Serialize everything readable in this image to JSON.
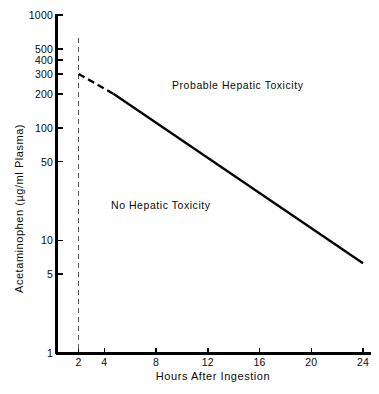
{
  "chart_data": {
    "type": "line",
    "title": "",
    "xlabel": "Hours After Ingestion",
    "ylabel": "Acetaminophen (µg/ml Plasma)",
    "xscale": "linear",
    "yscale": "log",
    "xlim": [
      0.7,
      25.2
    ],
    "ylim": [
      1,
      1000
    ],
    "grid": false,
    "legend": "none",
    "xticks": [
      {
        "value": 2,
        "label": "2"
      },
      {
        "value": 4,
        "label": "4"
      },
      {
        "value": 8,
        "label": "8"
      },
      {
        "value": 12,
        "label": "12"
      },
      {
        "value": 16,
        "label": "16"
      },
      {
        "value": 20,
        "label": "20"
      },
      {
        "value": 24,
        "label": "24"
      }
    ],
    "yticks": [
      {
        "value": 1,
        "label": "1"
      },
      {
        "value": 5,
        "label": "5"
      },
      {
        "value": 10,
        "label": "10"
      },
      {
        "value": 50,
        "label": "50"
      },
      {
        "value": 100,
        "label": "100"
      },
      {
        "value": 200,
        "label": "200"
      },
      {
        "value": 300,
        "label": "300"
      },
      {
        "value": 400,
        "label": "400"
      },
      {
        "value": 500,
        "label": "500"
      },
      {
        "value": 1000,
        "label": "1000"
      }
    ],
    "series": [
      {
        "name": "treatment-line",
        "style": "solid-with-dashed-lead",
        "color": "#000000",
        "x": [
          2,
          24
        ],
        "y": [
          300,
          6.25
        ],
        "dashed_lead_x": [
          2,
          4.7
        ],
        "dashed_lead_y": [
          300,
          200
        ]
      },
      {
        "name": "four-hour-reference-line",
        "style": "dashed-vertical",
        "color": "#555555",
        "x": [
          2,
          2
        ],
        "y": [
          1,
          620
        ]
      }
    ],
    "annotations": [
      {
        "name": "probable-hepatic-toxicity",
        "text": "Probable Hepatic Toxicity",
        "x": 7.6,
        "y": 240
      },
      {
        "name": "no-hepatic-toxicity",
        "text": "No Hepatic Toxicity",
        "x": 4.2,
        "y": 22
      }
    ]
  },
  "axes": {
    "x_title": "Hours After Ingestion",
    "y_title": "Acetaminophen (µg/ml Plasma)"
  },
  "regions": {
    "upper": "Probable Hepatic Toxicity",
    "lower": "No Hepatic Toxicity"
  },
  "colors": {
    "background": "#ffffff",
    "axis": "#000000",
    "line": "#000000",
    "dashed": "#555555",
    "text": "#0a0a0a"
  }
}
